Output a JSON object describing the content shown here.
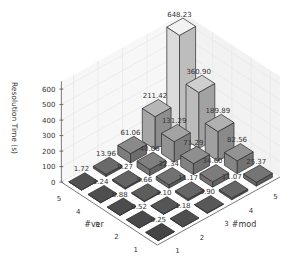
{
  "chart_data": {
    "type": "bar3d",
    "title": "",
    "xlabel": "#mod",
    "ylabel": "#ver",
    "zlabel": "Resolution Time (s)",
    "x_ticks": [
      "1",
      "2",
      "3",
      "4",
      "5"
    ],
    "y_ticks": [
      "1",
      "2",
      "3",
      "4",
      "5"
    ],
    "z_ticks": [
      "0",
      "100",
      "200",
      "300",
      "400",
      "500",
      "600"
    ],
    "zlim": [
      0,
      650
    ],
    "grid": true,
    "legend": null,
    "colormap": "grayscale (darker = lower value, lighter = higher value)",
    "series_axis": "rows indexed by #mod, columns indexed by #ver",
    "values": [
      {
        "mod": 1,
        "ver": 1,
        "value": 0.25,
        "label": "0.25"
      },
      {
        "mod": 1,
        "ver": 2,
        "value": 0.52,
        "label": "0.52"
      },
      {
        "mod": 1,
        "ver": 3,
        "value": 0.88,
        "label": "0.88"
      },
      {
        "mod": 1,
        "ver": 4,
        "value": 1.24,
        "label": "1.24"
      },
      {
        "mod": 1,
        "ver": 5,
        "value": 1.72,
        "label": "1.72"
      },
      {
        "mod": 2,
        "ver": 1,
        "value": 1.18,
        "label": "1.18"
      },
      {
        "mod": 2,
        "ver": 2,
        "value": 3.1,
        "label": "3.10"
      },
      {
        "mod": 2,
        "ver": 3,
        "value": 5.66,
        "label": "5.66"
      },
      {
        "mod": 2,
        "ver": 4,
        "value": 9.27,
        "label": "9.27"
      },
      {
        "mod": 2,
        "ver": 5,
        "value": 13.96,
        "label": "13.96"
      },
      {
        "mod": 3,
        "ver": 1,
        "value": 3.9,
        "label": "3.90"
      },
      {
        "mod": 3,
        "ver": 2,
        "value": 11.17,
        "label": "11.17"
      },
      {
        "mod": 3,
        "ver": 3,
        "value": 22.34,
        "label": "22.34"
      },
      {
        "mod": 3,
        "ver": 4,
        "value": 40.06,
        "label": "40.06"
      },
      {
        "mod": 3,
        "ver": 5,
        "value": 61.06,
        "label": "61.06"
      },
      {
        "mod": 4,
        "ver": 1,
        "value": 11.07,
        "label": "11.07"
      },
      {
        "mod": 4,
        "ver": 2,
        "value": 34.6,
        "label": "34.60"
      },
      {
        "mod": 4,
        "ver": 3,
        "value": 71.29,
        "label": "71.29"
      },
      {
        "mod": 4,
        "ver": 4,
        "value": 131.29,
        "label": "131.29"
      },
      {
        "mod": 4,
        "ver": 5,
        "value": 211.42,
        "label": "211.42"
      },
      {
        "mod": 5,
        "ver": 1,
        "value": 25.37,
        "label": "25.37"
      },
      {
        "mod": 5,
        "ver": 2,
        "value": 82.56,
        "label": "82.56"
      },
      {
        "mod": 5,
        "ver": 3,
        "value": 189.89,
        "label": "189.89"
      },
      {
        "mod": 5,
        "ver": 4,
        "value": 360.9,
        "label": "360.90"
      },
      {
        "mod": 5,
        "ver": 5,
        "value": 648.23,
        "label": "648.23"
      }
    ]
  },
  "colors": {
    "background": "#ffffff",
    "grid": "#e6e6e6",
    "axis": "#555555",
    "text": "#333333",
    "bar_edge": "#2a2a2a"
  }
}
